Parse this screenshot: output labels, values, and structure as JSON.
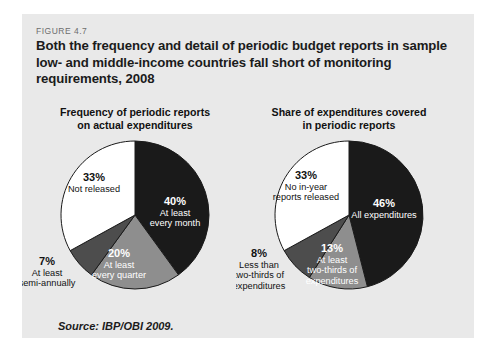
{
  "figure": {
    "label": "FIGURE 4.7",
    "title": "Both the frequency and detail of periodic budget reports in sample low- and middle-income countries fall short of monitoring requirements, 2008",
    "source": "Source: IBP/OBI 2009.",
    "background_color": "#e9e9e9",
    "page_color": "#ffffff"
  },
  "colors": {
    "black_slice": "#1a1a1a",
    "dark_grey_slice": "#4d4d4d",
    "mid_grey_slice": "#8e8e8e",
    "white_slice": "#ffffff",
    "slice_outline": "#1a1a1a",
    "text_dark": "#111111",
    "text_light": "#ffffff",
    "figure_label": "#6d6d6d"
  },
  "chart_data": [
    {
      "type": "pie",
      "id": "frequency-of-periodic-reports",
      "title": "Frequency of periodic reports on actual expenditures",
      "title_line1": "Frequency of periodic reports",
      "title_line2": "on actual expenditures",
      "categories": [
        "At least every month",
        "At least every quarter",
        "At least semi-annually",
        "Not released"
      ],
      "values": [
        40,
        20,
        7,
        33
      ],
      "value_labels": [
        "40%",
        "20%",
        "7%",
        "33%"
      ],
      "colors": [
        "#1a1a1a",
        "#8e8e8e",
        "#4d4d4d",
        "#ffffff"
      ],
      "label_colors": [
        "#ffffff",
        "#ffffff",
        "#111111",
        "#111111"
      ],
      "slices": [
        {
          "pct": "40%",
          "name_line1": "At least",
          "name_line2": "every month",
          "start_angle": 0,
          "end_angle": 144,
          "label_x": 153,
          "label_y": 68,
          "inside": true
        },
        {
          "pct": "20%",
          "name_line1": "At least",
          "name_line2": "every quarter",
          "start_angle": 144,
          "end_angle": 216,
          "label_x": 97,
          "label_y": 120,
          "inside": true
        },
        {
          "pct": "7%",
          "name_line1": "At least",
          "name_line2": "semi-annually",
          "start_angle": 216,
          "end_angle": 241.2,
          "label_x": 25,
          "label_y": 128,
          "inside": false
        },
        {
          "pct": "33%",
          "name_line1": "Not released",
          "name_line2": "",
          "start_angle": 241.2,
          "end_angle": 360,
          "label_x": 72,
          "label_y": 44,
          "inside": true
        }
      ]
    },
    {
      "type": "pie",
      "id": "share-of-expenditures-covered",
      "title": "Share of expenditures covered in periodic reports",
      "title_line1": "Share of expenditures covered",
      "title_line2": "in periodic reports",
      "categories": [
        "All expenditures",
        "At least two-thirds of expenditures",
        "Less than two-thirds of expenditures",
        "No in-year reports released"
      ],
      "values": [
        46,
        13,
        8,
        33
      ],
      "value_labels": [
        "46%",
        "13%",
        "8%",
        "33%"
      ],
      "colors": [
        "#1a1a1a",
        "#8e8e8e",
        "#4d4d4d",
        "#ffffff"
      ],
      "label_colors": [
        "#ffffff",
        "#ffffff",
        "#111111",
        "#111111"
      ],
      "slices": [
        {
          "pct": "46%",
          "name_line1": "All expenditures",
          "name_line2": "",
          "start_angle": 0,
          "end_angle": 165.6,
          "label_x": 148,
          "label_y": 70,
          "inside": true
        },
        {
          "pct": "13%",
          "name_line1": "At least",
          "name_line2": "two-thirds of",
          "name_line3": "expenditures",
          "start_angle": 165.6,
          "end_angle": 212.4,
          "label_x": 96,
          "label_y": 115,
          "inside": true
        },
        {
          "pct": "8%",
          "name_line1": "Less than",
          "name_line2": "two-thirds of",
          "name_line3": "expenditures",
          "start_angle": 212.4,
          "end_angle": 241.2,
          "label_x": 23,
          "label_y": 120,
          "inside": false
        },
        {
          "pct": "33%",
          "name_line1": "No in-year",
          "name_line2": "reports released",
          "start_angle": 241.2,
          "end_angle": 360,
          "label_x": 70,
          "label_y": 42,
          "inside": true
        }
      ]
    }
  ]
}
